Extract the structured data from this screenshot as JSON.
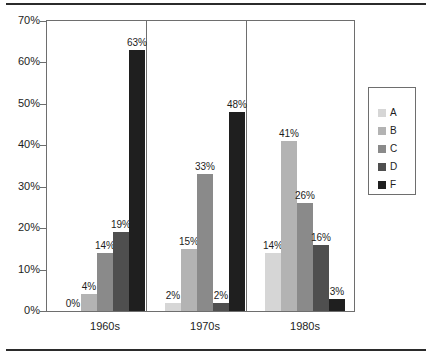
{
  "chart_data": {
    "type": "bar",
    "title": "",
    "subtitle": "",
    "xlabel": "",
    "ylabel": "",
    "categories": [
      "1960s",
      "1970s",
      "1980s"
    ],
    "series": [
      {
        "name": "A",
        "color": "#d6d6d6",
        "values": [
          0,
          2,
          14
        ],
        "labels": [
          "0%",
          "2%",
          "14%"
        ]
      },
      {
        "name": "B",
        "color": "#b3b3b3",
        "values": [
          4,
          15,
          41
        ],
        "labels": [
          "4%",
          "15%",
          "41%"
        ]
      },
      {
        "name": "C",
        "color": "#8a8a8a",
        "values": [
          14,
          33,
          26
        ],
        "labels": [
          "14%",
          "33%",
          "26%"
        ]
      },
      {
        "name": "D",
        "color": "#4f4f4f",
        "values": [
          19,
          2,
          16
        ],
        "labels": [
          "19%",
          "2%",
          "16%"
        ]
      },
      {
        "name": "F",
        "color": "#1f1f1f",
        "values": [
          63,
          48,
          3
        ],
        "labels": [
          "63%",
          "48%",
          "3%"
        ]
      }
    ],
    "ylim": [
      0,
      70
    ],
    "yticks": [
      0,
      10,
      20,
      30,
      40,
      50,
      60,
      70
    ],
    "ytick_labels": [
      "0%",
      "10%",
      "20%",
      "30%",
      "40%",
      "50%",
      "60%",
      "70%"
    ],
    "grid": false,
    "legend_position": "right",
    "legend_entries": [
      "A",
      "B",
      "C",
      "D",
      "F"
    ],
    "value_labels_shown": true,
    "group_separators": true
  },
  "axes": {
    "y_tick_labels": [
      "70%",
      "60%",
      "50%",
      "40%",
      "30%",
      "20%",
      "10%",
      "0%"
    ],
    "x_category_labels": [
      "1960s",
      "1970s",
      "1980s"
    ]
  },
  "legend": {
    "items": [
      {
        "label": "A",
        "color": "#d6d6d6"
      },
      {
        "label": "B",
        "color": "#b3b3b3"
      },
      {
        "label": "C",
        "color": "#8a8a8a"
      },
      {
        "label": "D",
        "color": "#4f4f4f"
      },
      {
        "label": "F",
        "color": "#1f1f1f"
      }
    ]
  },
  "style": {
    "axis_color": "#6e6e6e",
    "text_color": "#1d1d1d",
    "rule_color": "#2b2b2b",
    "background": "#ffffff"
  }
}
